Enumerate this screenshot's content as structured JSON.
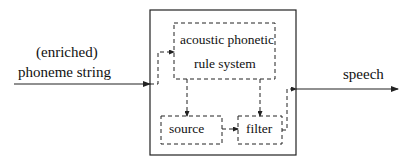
{
  "diagram": {
    "input": {
      "line1": "(enriched)",
      "line2": "phoneme string"
    },
    "output": {
      "label": "speech"
    },
    "blocks": {
      "rule_system": {
        "line1": "acoustic phonetic",
        "line2": "rule system"
      },
      "source": {
        "label": "source"
      },
      "filter": {
        "label": "filter"
      }
    },
    "colors": {
      "stroke": "#222222",
      "background": "#ffffff"
    }
  }
}
